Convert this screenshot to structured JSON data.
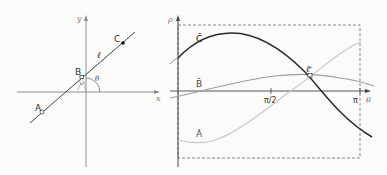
{
  "left_panel": {
    "axes": {
      "x_label": "x",
      "y_label": "y"
    },
    "line_label": "ℓ",
    "points": [
      {
        "name": "A",
        "label": "A"
      },
      {
        "name": "B",
        "label": "B"
      },
      {
        "name": "C",
        "label": "C"
      }
    ],
    "angle_label": "θ"
  },
  "right_panel": {
    "axes": {
      "x_label": "θ",
      "y_label": "ρ"
    },
    "ticks": [
      {
        "label": "π/2"
      },
      {
        "label": "π"
      }
    ],
    "curves": [
      {
        "name": "C-bar",
        "label": "C̄",
        "color": "#2a2a2a"
      },
      {
        "name": "B-bar",
        "label": "B̄",
        "color": "#9a9a9a"
      },
      {
        "name": "A-bar",
        "label": "Ā",
        "color": "#c4c4c4"
      }
    ],
    "intersection_label": "ℓ̄"
  }
}
